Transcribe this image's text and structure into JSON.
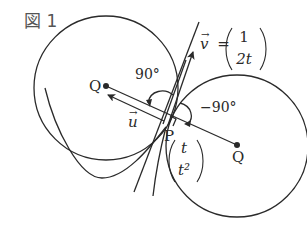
{
  "figure": {
    "title": "図 1",
    "labels": {
      "center_left": "Q",
      "center_right": "Q",
      "point": "P",
      "angle_ccw": "90°",
      "angle_cw": "−90°",
      "vector_u": "u",
      "vector_v": "v",
      "equals": "="
    },
    "vector_v_components": [
      "1",
      "2t"
    ],
    "point_p_components": [
      "t",
      "t²"
    ],
    "colors": {
      "stroke": "#2a2a2a",
      "background": "#ffffff"
    }
  }
}
